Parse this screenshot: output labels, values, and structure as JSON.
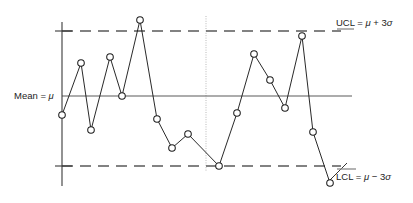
{
  "chart_data": {
    "type": "line",
    "title": "",
    "subtitle": "",
    "xlabel": "",
    "ylabel": "",
    "grid": false,
    "legend_position": "none",
    "axis": {
      "x_axis_shown": false,
      "y_axis_shown": true,
      "x_range_units": "sample sequence number",
      "y_range_sigma": [
        -3.6,
        3.6
      ]
    },
    "reference_lines": [
      {
        "name": "upper-control-limit",
        "label": "UCL",
        "value_sigma": 3,
        "style": "dashed"
      },
      {
        "name": "center-line",
        "label": "Mean",
        "value_sigma": 0,
        "style": "solid"
      },
      {
        "name": "lower-control-limit",
        "label": "LCL",
        "value_sigma": -3,
        "style": "dashed"
      }
    ],
    "divider": {
      "name": "phase-divider",
      "style": "dotted",
      "after_sample": 10
    },
    "x": [
      1,
      2,
      3,
      4,
      5,
      6,
      7,
      8,
      9,
      10,
      11,
      12,
      13,
      14,
      15,
      16,
      17
    ],
    "series": [
      {
        "name": "sample-observations",
        "marker": "open-circle",
        "values_sigma": [
          -1.4,
          1.2,
          -2.5,
          1.5,
          0.0,
          3.8,
          -1.15,
          -2.5,
          -1.85,
          -3.0,
          -0.85,
          2.1,
          0.75,
          -0.55,
          2.9,
          -1.65,
          -3.6
        ]
      }
    ],
    "points_px": [
      {
        "x": 62,
        "y": 115
      },
      {
        "x": 81,
        "y": 63
      },
      {
        "x": 91,
        "y": 130
      },
      {
        "x": 110,
        "y": 57
      },
      {
        "x": 122,
        "y": 96
      },
      {
        "x": 140,
        "y": 20
      },
      {
        "x": 157,
        "y": 119
      },
      {
        "x": 172,
        "y": 148
      },
      {
        "x": 188,
        "y": 134
      },
      {
        "x": 219,
        "y": 166
      },
      {
        "x": 237,
        "y": 113
      },
      {
        "x": 254,
        "y": 54
      },
      {
        "x": 270,
        "y": 80
      },
      {
        "x": 285,
        "y": 108
      },
      {
        "x": 302,
        "y": 36
      },
      {
        "x": 313,
        "y": 132
      },
      {
        "x": 330,
        "y": 183
      }
    ]
  },
  "labels": {
    "mean": {
      "prefix": "Mean = ",
      "symbol": "μ"
    },
    "ucl": {
      "prefix": "UCL = ",
      "symbol": "μ",
      "operator": " + 3",
      "sigma": "σ"
    },
    "lcl": {
      "prefix": "LCL = ",
      "symbol": "μ",
      "operator": " − 3",
      "sigma": "σ"
    }
  },
  "colors": {
    "series_stroke": "#1d1d1d",
    "marker_fill": "#ffffff",
    "mean_line": "#5a5a5a",
    "limit_line": "#5a5a5a",
    "axis_line": "#3a3a3a",
    "divider_line": "#b9b9b9",
    "background": "#ffffff",
    "text": "#1d1d1d"
  },
  "geometry": {
    "axis_x": 62,
    "axis_top": 22,
    "axis_bottom": 186,
    "mean_y": 96,
    "ucl_y": 31,
    "lcl_y": 166,
    "line_left": 62,
    "mean_right": 352,
    "limit_right": 341,
    "divider_x": 206,
    "divider_top": 16,
    "divider_bottom": 172
  }
}
